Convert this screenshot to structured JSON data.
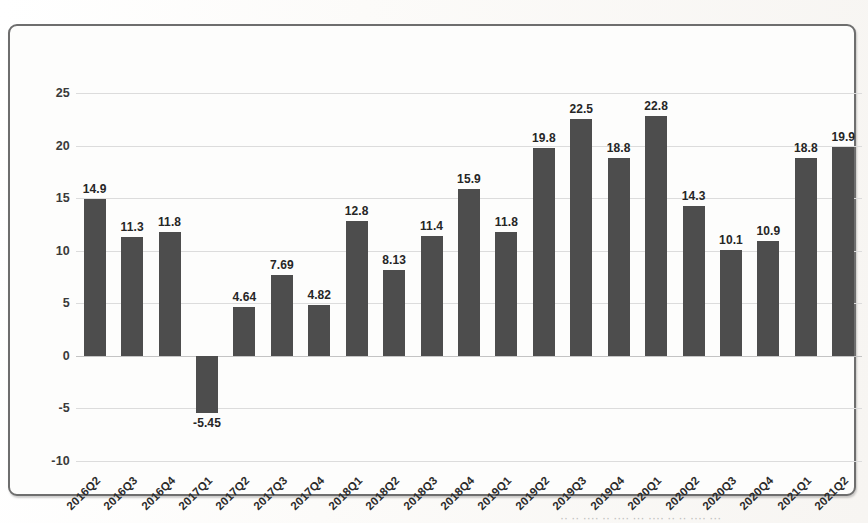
{
  "chart_data": {
    "type": "bar",
    "title": "",
    "subtitle": "",
    "xlabel": "",
    "ylabel": "",
    "ylim": [
      -10,
      25
    ],
    "ytick_step": 5,
    "yticks": [
      "25",
      "20",
      "15",
      "10",
      "5",
      "0",
      "-5",
      "-10"
    ],
    "grid": true,
    "legend": false,
    "bar_color": "#4d4d4d",
    "categories": [
      "2016Q2",
      "2016Q3",
      "2016Q4",
      "2017Q1",
      "2017Q2",
      "2017Q3",
      "2017Q4",
      "2018Q1",
      "2018Q2",
      "2018Q3",
      "2018Q4",
      "2019Q1",
      "2019Q2",
      "2019Q3",
      "2019Q4",
      "2020Q1",
      "2020Q2",
      "2020Q3",
      "2020Q4",
      "2021Q1",
      "2021Q2"
    ],
    "values": [
      14.9,
      11.3,
      11.8,
      -5.45,
      4.64,
      7.69,
      4.82,
      12.8,
      8.13,
      11.4,
      15.9,
      11.8,
      19.8,
      22.5,
      18.8,
      22.8,
      14.3,
      10.1,
      10.9,
      18.8,
      19.9
    ],
    "data_labels": [
      "14.9",
      "11.3",
      "11.8",
      "-5.45",
      "4.64",
      "7.69",
      "4.82",
      "12.8",
      "8.13",
      "11.4",
      "15.9",
      "11.8",
      "19.8",
      "22.5",
      "18.8",
      "22.8",
      "14.3",
      "10.1",
      "10.9",
      "18.8",
      "19.9"
    ]
  },
  "caption": {
    "text": "·· ·· ···· ·· ···· ··· ···· ·· ·· ···· ···"
  }
}
